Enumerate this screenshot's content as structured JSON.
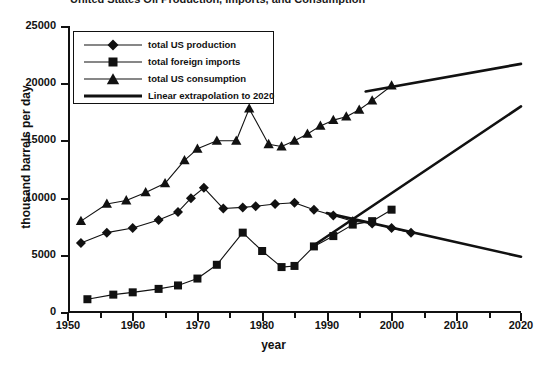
{
  "title_fragment": "United States Oil Production, Imports, and Consumption",
  "axes": {
    "xlabel": "year",
    "ylabel": "thousand barrels per day",
    "xlim": [
      1950,
      2020
    ],
    "ylim": [
      0,
      25000
    ],
    "xticks": [
      1950,
      1960,
      1970,
      1980,
      1990,
      2000,
      2010,
      2020
    ],
    "yticks": [
      0,
      5000,
      10000,
      15000,
      20000,
      25000
    ],
    "xminor": [
      1955,
      1965,
      1975,
      1985,
      1995,
      2005,
      2015
    ],
    "grid": false
  },
  "legend": {
    "position": "upper-left-inside",
    "items": [
      {
        "label": "total US production",
        "marker": "diamond"
      },
      {
        "label": "total foreign imports",
        "marker": "square"
      },
      {
        "label": "total US consumption",
        "marker": "triangle"
      },
      {
        "label": "Linear extrapolation to 2020",
        "marker": "line"
      }
    ]
  },
  "colors": {
    "ink": "#111111",
    "background": "#ffffff"
  },
  "chart_data": {
    "type": "line",
    "title": "United States Oil Production, Imports, and Consumption",
    "xlabel": "year",
    "ylabel": "thousand barrels per day",
    "xlim": [
      1950,
      2020
    ],
    "ylim": [
      0,
      25000
    ],
    "series": [
      {
        "name": "total US production",
        "marker": "diamond",
        "x": [
          1952,
          1956,
          1960,
          1964,
          1967,
          1969,
          1971,
          1974,
          1977,
          1979,
          1982,
          1985,
          1988,
          1991,
          1994,
          1997,
          2000,
          2003
        ],
        "y": [
          6100,
          7000,
          7400,
          8100,
          8800,
          10000,
          10900,
          9100,
          9200,
          9300,
          9500,
          9600,
          9000,
          8500,
          8000,
          7800,
          7400,
          7000
        ]
      },
      {
        "name": "total foreign imports",
        "marker": "square",
        "x": [
          1953,
          1957,
          1960,
          1964,
          1967,
          1970,
          1973,
          1977,
          1980,
          1983,
          1985,
          1988,
          1991,
          1994,
          1997,
          2000
        ],
        "y": [
          1200,
          1600,
          1800,
          2100,
          2400,
          3000,
          4200,
          7000,
          5400,
          4000,
          4100,
          5800,
          6700,
          7700,
          8000,
          9000
        ]
      },
      {
        "name": "total US consumption",
        "marker": "triangle",
        "x": [
          1952,
          1956,
          1959,
          1962,
          1965,
          1968,
          1970,
          1973,
          1976,
          1978,
          1981,
          1983,
          1985,
          1987,
          1989,
          1991,
          1993,
          1995,
          1997,
          2000
        ],
        "y": [
          8000,
          9500,
          9800,
          10500,
          11300,
          13300,
          14300,
          15000,
          15000,
          17800,
          14700,
          14500,
          15000,
          15600,
          16300,
          16800,
          17100,
          17700,
          18500,
          19800
        ]
      },
      {
        "name": "Linear extrapolation to 2020 (consumption)",
        "marker": "line",
        "x": [
          1996,
          2020
        ],
        "y": [
          19300,
          21700
        ]
      },
      {
        "name": "Linear extrapolation to 2020 (imports)",
        "marker": "line",
        "x": [
          1988,
          2020
        ],
        "y": [
          5900,
          18000
        ]
      },
      {
        "name": "Linear extrapolation to 2020 (production)",
        "marker": "line",
        "x": [
          1990,
          2020
        ],
        "y": [
          8700,
          4900
        ]
      }
    ]
  }
}
